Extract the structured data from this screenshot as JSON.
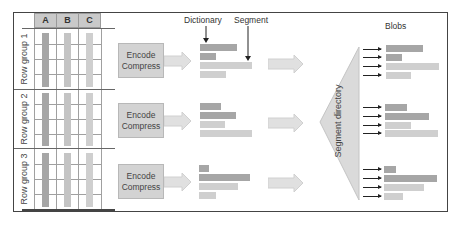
{
  "diagram": {
    "table": {
      "columns": [
        "A",
        "B",
        "C"
      ],
      "row_groups": [
        "Row group 1",
        "Row group 2",
        "Row group 3"
      ]
    },
    "encode_box": {
      "line1": "Encode",
      "line2": "Compress"
    },
    "labels": {
      "dictionary": "Dictionary",
      "segment": "Segment",
      "blobs": "Blobs",
      "segment_directory": "Segment directory"
    },
    "colors": {
      "dark_bar": "#a6a6a6",
      "mid_bar": "#bdbdbd",
      "light_bar": "#cfcfcf",
      "arrow_fill": "#e0e0e0",
      "triangle_fill": "#dadada",
      "header_fill": "#c9c9c9"
    },
    "segment_groups": [
      {
        "bars": [
          {
            "w": 37,
            "shade": "dark"
          },
          {
            "w": 16,
            "shade": "dark"
          },
          {
            "w": 52,
            "shade": "light"
          },
          {
            "w": 26,
            "shade": "light"
          }
        ]
      },
      {
        "bars": [
          {
            "w": 21,
            "shade": "dark"
          },
          {
            "w": 36,
            "shade": "dark"
          },
          {
            "w": 25,
            "shade": "light"
          },
          {
            "w": 52,
            "shade": "light"
          }
        ]
      },
      {
        "bars": [
          {
            "w": 10,
            "shade": "dark"
          },
          {
            "w": 51,
            "shade": "dark"
          },
          {
            "w": 39,
            "shade": "light"
          },
          {
            "w": 17,
            "shade": "light"
          }
        ]
      }
    ]
  }
}
